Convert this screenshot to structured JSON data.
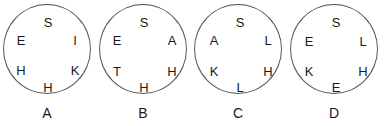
{
  "options": [
    {
      "label": "A",
      "letters": {
        "top": "S",
        "upper_left": "E",
        "upper_right": "I",
        "lower_left": "H",
        "lower_right": "K",
        "bottom": "H"
      }
    },
    {
      "label": "B",
      "letters": {
        "top": "S",
        "upper_left": "E",
        "upper_right": "A",
        "lower_left": "T",
        "lower_right": "H",
        "bottom": "H"
      }
    },
    {
      "label": "C",
      "letters": {
        "top": "S",
        "upper_left": "A",
        "upper_right": "L",
        "lower_left": "K",
        "lower_right": "H",
        "bottom": "L"
      }
    },
    {
      "label": "D",
      "letters": {
        "top": "S",
        "upper_left": "E",
        "upper_right": "L",
        "lower_left": "K",
        "lower_right": "H",
        "bottom": "E"
      }
    }
  ]
}
